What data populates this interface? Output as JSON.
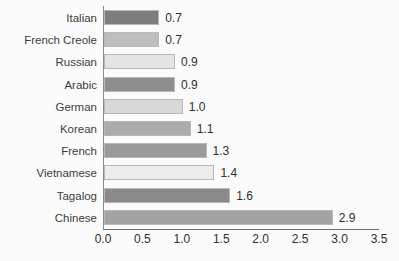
{
  "chart_data": {
    "type": "bar",
    "orientation": "horizontal",
    "title": "",
    "subtitle": "",
    "xlabel": "",
    "ylabel": "",
    "xlim": [
      0.0,
      3.5
    ],
    "xticks": [
      "0.0",
      "0.5",
      "1.0",
      "1.5",
      "2.0",
      "2.5",
      "3.0",
      "3.5"
    ],
    "grid": false,
    "legend": null,
    "categories": [
      "Italian",
      "French Creole",
      "Russian",
      "Arabic",
      "German",
      "Korean",
      "French",
      "Vietnamese",
      "Tagalog",
      "Chinese"
    ],
    "values": [
      0.7,
      0.7,
      0.9,
      0.9,
      1.0,
      1.1,
      1.3,
      1.4,
      1.6,
      2.9
    ],
    "data_labels": [
      "0.7",
      "0.7",
      "0.9",
      "0.9",
      "1.0",
      "1.1",
      "1.3",
      "1.4",
      "1.6",
      "2.9"
    ],
    "bar_colors": [
      "#7d7d7d",
      "#bdbdbd",
      "#e4e4e4",
      "#8e8e8e",
      "#d8d8d8",
      "#ababab",
      "#9a9a9a",
      "#ececec",
      "#8a8a8a",
      "#a3a3a3"
    ],
    "bar_border_color": "#b8b8b8",
    "background_color": "#fbfbfb",
    "axis_color": "#6e6e6e",
    "text_color": "#3b3b3b"
  }
}
